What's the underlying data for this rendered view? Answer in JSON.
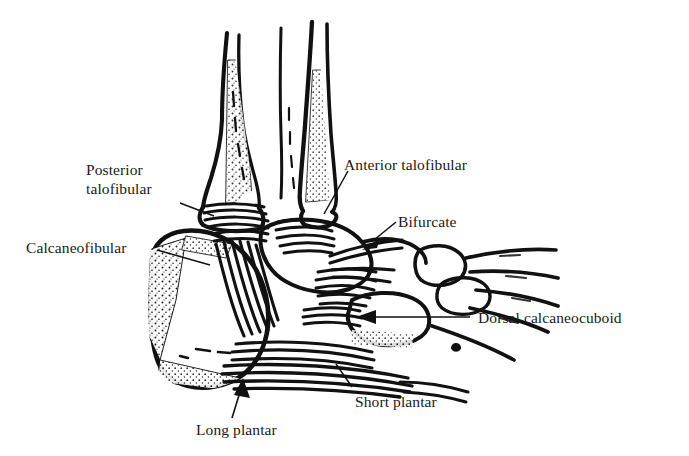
{
  "figure": {
    "kind": "anatomical-line-drawing",
    "ink_color": "#111111",
    "background_color": "#ffffff"
  },
  "labels": [
    {
      "id": "posterior-talofibular",
      "name": "Posterior talofibular",
      "line1": "Posterior",
      "line2": "talofibular",
      "x": 86,
      "y": 160,
      "leader": "line"
    },
    {
      "id": "calcaneofibular",
      "name": "Calcaneofibular",
      "line1": "Calcaneofibular",
      "line2": "",
      "x": 26,
      "y": 238,
      "leader": "line"
    },
    {
      "id": "anterior-talofibular",
      "name": "Anterior talofibular",
      "line1": "Anterior talofibular",
      "line2": "",
      "x": 344,
      "y": 155,
      "leader": "line"
    },
    {
      "id": "bifurcate",
      "name": "Bifurcate",
      "line1": "Bifurcate",
      "line2": "",
      "x": 398,
      "y": 212,
      "leader": "arrow"
    },
    {
      "id": "dorsal-calcaneocuboid",
      "name": "Dorsal calcaneocuboid",
      "line1": "Dorsal calcaneocuboid",
      "line2": "",
      "x": 478,
      "y": 308,
      "leader": "arrow"
    },
    {
      "id": "short-plantar",
      "name": "Short plantar",
      "line1": "Short plantar",
      "line2": "",
      "x": 355,
      "y": 392,
      "leader": "line"
    },
    {
      "id": "long-plantar",
      "name": "Long plantar",
      "line1": "Long plantar",
      "line2": "",
      "x": 196,
      "y": 420,
      "leader": "arrow"
    }
  ]
}
